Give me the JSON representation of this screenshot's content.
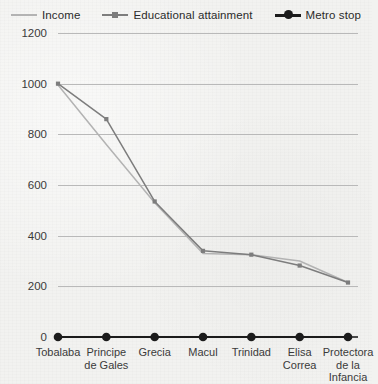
{
  "chart_data": {
    "type": "line",
    "title": "",
    "xlabel": "",
    "ylabel": "",
    "ylim": [
      0,
      1200
    ],
    "ytick_step": 200,
    "yticks": [
      "0",
      "200",
      "400",
      "600",
      "800",
      "1000",
      "1200"
    ],
    "grid": true,
    "legend_position": "top",
    "categories": [
      "Tobalaba",
      "Principe de Gales",
      "Grecia",
      "Macul",
      "Trinidad",
      "Elisa Correa",
      "Protectora de la Infancia"
    ],
    "category_lines": [
      [
        "Tobalaba"
      ],
      [
        "Principe",
        "de Gales"
      ],
      [
        "Grecia"
      ],
      [
        "Macul"
      ],
      [
        "Trinidad"
      ],
      [
        "Elisa",
        "Correa"
      ],
      [
        "Protectora",
        "de la",
        "Infancia"
      ]
    ],
    "series": [
      {
        "name": "Income",
        "color": "#b3b3b3",
        "marker": "none",
        "values": [
          995,
          760,
          530,
          330,
          325,
          300,
          215
        ]
      },
      {
        "name": "Educational attainment",
        "color": "#7d7d7d",
        "marker": "square",
        "values": [
          1000,
          860,
          535,
          340,
          325,
          282,
          215
        ]
      },
      {
        "name": "Metro stop",
        "color": "#1c1c1c",
        "marker": "circle",
        "values": [
          0,
          0,
          0,
          0,
          0,
          0,
          0
        ]
      }
    ]
  },
  "legend": {
    "entries": [
      {
        "label": "Income",
        "color": "#b3b3b3",
        "marker": "none"
      },
      {
        "label": "Educational attainment",
        "color": "#7d7d7d",
        "marker": "square"
      },
      {
        "label": "Metro stop",
        "color": "#1c1c1c",
        "marker": "circle"
      }
    ]
  },
  "colors": {
    "background": "#f2f2f0",
    "gridline": "#b9b9b9",
    "axis": "#4a4a4a",
    "text": "#3a3a3a",
    "income": "#b3b3b3",
    "educational_attainment": "#7d7d7d",
    "metro_stop": "#1c1c1c"
  },
  "geometry": {
    "plot_left": 58,
    "plot_right": 348,
    "plot_top": 33,
    "plot_bottom": 337
  }
}
